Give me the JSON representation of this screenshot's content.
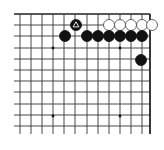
{
  "board": {
    "description": "Go board fragment (top-right corner)",
    "grid": {
      "x_lines": [
        20,
        31,
        42,
        53,
        64,
        75,
        87,
        98,
        109,
        120,
        131,
        142,
        150
      ],
      "y_lines": [
        14,
        25,
        36,
        48,
        59,
        70,
        81,
        92,
        104,
        115,
        126
      ],
      "left_extent": 14,
      "bottom_extent": 134,
      "line_color": "#333333",
      "edge_color": "#222222"
    },
    "star_points": [
      {
        "x": 53,
        "y": 48
      },
      {
        "x": 120,
        "y": 48
      },
      {
        "x": 53,
        "y": 116
      },
      {
        "x": 120,
        "y": 116
      }
    ],
    "stones": [
      {
        "color": "black",
        "x": 76,
        "y": 25,
        "marker": "triangle"
      },
      {
        "color": "white",
        "x": 109,
        "y": 25
      },
      {
        "color": "white",
        "x": 120,
        "y": 25
      },
      {
        "color": "white",
        "x": 131,
        "y": 25
      },
      {
        "color": "white",
        "x": 142,
        "y": 25
      },
      {
        "color": "white",
        "x": 152,
        "y": 25
      },
      {
        "color": "black",
        "x": 65,
        "y": 36
      },
      {
        "color": "black",
        "x": 87,
        "y": 36
      },
      {
        "color": "black",
        "x": 98,
        "y": 36
      },
      {
        "color": "black",
        "x": 109,
        "y": 36
      },
      {
        "color": "black",
        "x": 120,
        "y": 36
      },
      {
        "color": "black",
        "x": 131,
        "y": 36
      },
      {
        "color": "black",
        "x": 142,
        "y": 36
      },
      {
        "color": "black",
        "x": 141,
        "y": 60
      }
    ],
    "stone_radius": 5.5,
    "colors": {
      "black": "#111111",
      "white": "#ffffff",
      "white_stroke": "#444444",
      "marker": "#ffffff"
    }
  }
}
